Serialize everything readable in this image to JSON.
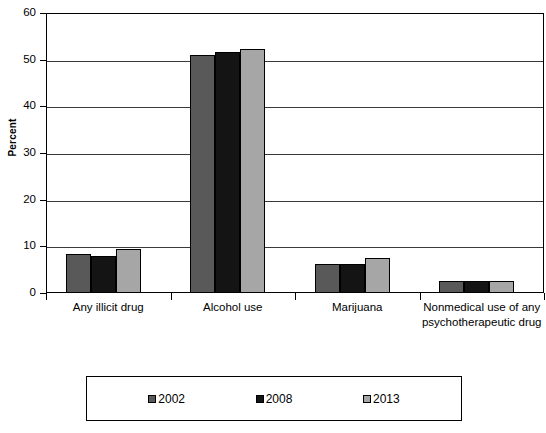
{
  "chart_data": {
    "type": "bar",
    "title": "",
    "xlabel": "",
    "ylabel": "Percent",
    "ylim": [
      0,
      60
    ],
    "ytick_step": 10,
    "yticks": [
      0,
      10,
      20,
      30,
      40,
      50,
      60
    ],
    "grid": true,
    "legend_position": "bottom",
    "categories": [
      "Any illicit drug",
      "Alcohol use",
      "Marijuana",
      "Nonmedical use of any psychotherapeutic drug"
    ],
    "series": [
      {
        "name": "2002",
        "color": "#595959",
        "values": [
          8.3,
          51.0,
          6.2,
          2.6
        ]
      },
      {
        "name": "2008",
        "color": "#141414",
        "values": [
          8.0,
          51.6,
          6.2,
          2.5
        ]
      },
      {
        "name": "2013",
        "color": "#a6a6a6",
        "values": [
          9.4,
          52.3,
          7.5,
          2.5
        ]
      }
    ]
  },
  "axis": {
    "y_title": "Percent",
    "y_labels": [
      "60",
      "50",
      "40",
      "30",
      "20",
      "10",
      "0"
    ]
  },
  "legend": {
    "entries": [
      {
        "label": "2002",
        "color": "#595959"
      },
      {
        "label": "2008",
        "color": "#141414"
      },
      {
        "label": "2013",
        "color": "#a6a6a6"
      }
    ]
  },
  "colors": {
    "series_2002": "#595959",
    "series_2008": "#141414",
    "series_2013": "#a6a6a6",
    "axis": "#000000",
    "gridline": "#3a3a3a",
    "background": "#ffffff"
  }
}
